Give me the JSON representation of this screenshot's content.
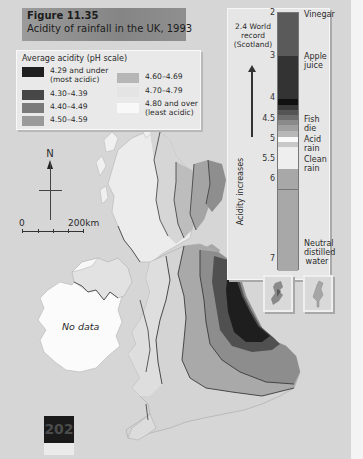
{
  "figure": {
    "number": "Figure 11.35",
    "caption": "Acidity of rainfall in the UK, 1993"
  },
  "legend": {
    "title": "Average acidity (pH scale)",
    "items": [
      {
        "label_line1": "4.29 and under",
        "label_line2": "(most acidic)",
        "color": "#1f1f1f"
      },
      {
        "label_line1": "4.30–4.39",
        "label_line2": "",
        "color": "#474747"
      },
      {
        "label_line1": "4.40–4.49",
        "label_line2": "",
        "color": "#7a7a7a"
      },
      {
        "label_line1": "4.50–4.59",
        "label_line2": "",
        "color": "#9a9a9a"
      },
      {
        "label_line1": "4.60–4.69",
        "label_line2": "",
        "color": "#b6b6b6"
      },
      {
        "label_line1": "4.70–4.79",
        "label_line2": "",
        "color": "#dcdcdc"
      },
      {
        "label_line1": "4.80 and over",
        "label_line2": "(least acidic)",
        "color": "#f6f6f6"
      }
    ]
  },
  "ph_scale": {
    "world_record": "2.4 World record (Scotland)",
    "axis_label": "Acidity increases",
    "ticks": [
      "2",
      "3",
      "4",
      "4.5",
      "5",
      "5.5",
      "6",
      "7"
    ],
    "labels": [
      {
        "text": "Vinegar",
        "ph": "2"
      },
      {
        "text": "Apple juice",
        "ph": "3"
      },
      {
        "text": "Fish die",
        "ph": "4.5"
      },
      {
        "text": "Acid rain",
        "ph": "5.2"
      },
      {
        "text": "Clean rain",
        "ph": "5.6"
      },
      {
        "text": "Neutral distilled water",
        "ph": "7"
      }
    ]
  },
  "map": {
    "north_label": "N",
    "scale_start": "0",
    "scale_end": "200km",
    "ireland_label": "No data"
  },
  "page": {
    "number": "202"
  }
}
